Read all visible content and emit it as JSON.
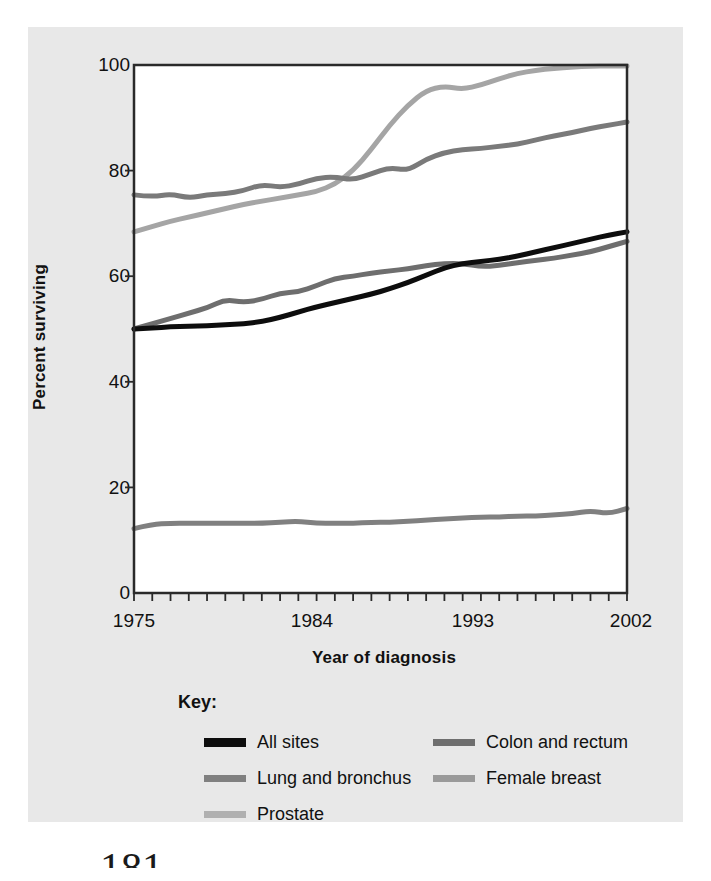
{
  "chart_data": {
    "type": "line",
    "title": "",
    "xlabel": "Year of diagnosis",
    "ylabel": "Percent surviving",
    "xlim": [
      1975,
      2002
    ],
    "ylim": [
      0,
      100
    ],
    "grid": false,
    "legend_position": "below",
    "legend_title": "Key:",
    "x_tick_labels": [
      "1975",
      "1984",
      "1993",
      "2002"
    ],
    "x_tick_values": [
      1975,
      1984,
      1993,
      2002
    ],
    "y_tick_labels": [
      "0",
      "20",
      "40",
      "60",
      "80",
      "100"
    ],
    "y_tick_values": [
      0,
      20,
      40,
      60,
      80,
      100
    ],
    "x": [
      1975,
      1976,
      1977,
      1978,
      1979,
      1980,
      1981,
      1982,
      1983,
      1984,
      1985,
      1986,
      1987,
      1988,
      1989,
      1990,
      1991,
      1992,
      1993,
      1994,
      1995,
      1996,
      1997,
      1998,
      1999,
      2000,
      2001,
      2002
    ],
    "series": [
      {
        "name": "All sites",
        "color": "#0d0d0d",
        "width": 5,
        "values": [
          50.0,
          50.2,
          50.4,
          50.5,
          50.6,
          50.8,
          51.0,
          51.4,
          52.2,
          53.2,
          54.2,
          55.0,
          55.8,
          56.6,
          57.6,
          58.8,
          60.2,
          61.6,
          62.4,
          62.8,
          63.2,
          63.8,
          64.6,
          65.4,
          66.2,
          67.0,
          67.8,
          68.4
        ]
      },
      {
        "name": "Colon and rectum",
        "color": "#6e6e6e",
        "width": 5,
        "values": [
          50.0,
          51.0,
          52.0,
          53.0,
          54.0,
          55.6,
          55.0,
          55.6,
          56.8,
          57.0,
          58.2,
          59.6,
          60.0,
          60.6,
          61.0,
          61.4,
          62.0,
          62.4,
          62.4,
          61.8,
          62.0,
          62.6,
          63.0,
          63.4,
          64.0,
          64.6,
          65.6,
          66.6
        ]
      },
      {
        "name": "Lung and bronchus",
        "color": "#808080",
        "width": 5,
        "values": [
          12.2,
          13.0,
          13.2,
          13.2,
          13.2,
          13.2,
          13.2,
          13.2,
          13.4,
          13.6,
          13.2,
          13.2,
          13.2,
          13.4,
          13.4,
          13.6,
          13.8,
          14.0,
          14.2,
          14.4,
          14.4,
          14.6,
          14.6,
          14.8,
          15.0,
          15.6,
          15.0,
          16.0
        ]
      },
      {
        "name": "Female breast",
        "color": "#7a7a7a",
        "width": 5,
        "values": [
          75.4,
          75.0,
          75.6,
          74.8,
          75.4,
          75.6,
          76.2,
          77.4,
          76.8,
          77.4,
          78.6,
          78.8,
          78.2,
          79.4,
          80.6,
          80.0,
          82.2,
          83.4,
          84.0,
          84.2,
          84.6,
          85.0,
          85.8,
          86.6,
          87.2,
          88.0,
          88.6,
          89.2
        ]
      },
      {
        "name": "Prostate",
        "color": "#a5a5a5",
        "width": 5,
        "values": [
          68.4,
          69.4,
          70.4,
          71.2,
          72.0,
          72.8,
          73.6,
          74.2,
          74.8,
          75.4,
          76.0,
          77.4,
          80.0,
          84.0,
          88.6,
          92.4,
          95.2,
          96.0,
          95.4,
          96.2,
          97.4,
          98.4,
          99.0,
          99.4,
          99.6,
          99.8,
          99.8,
          99.8
        ]
      }
    ]
  },
  "legend": {
    "title": "Key:",
    "items": [
      {
        "label": "All sites",
        "color": "#0d0d0d",
        "thick": true
      },
      {
        "label": "Colon and rectum",
        "color": "#6e6e6e",
        "thick": false
      },
      {
        "label": "Lung and bronchus",
        "color": "#808080",
        "thick": false
      },
      {
        "label": "Female breast",
        "color": "#7a7a7a",
        "thick": false
      },
      {
        "label": "Prostate",
        "color": "#a5a5a5",
        "thick": false
      }
    ]
  },
  "page": {
    "number": "181"
  }
}
